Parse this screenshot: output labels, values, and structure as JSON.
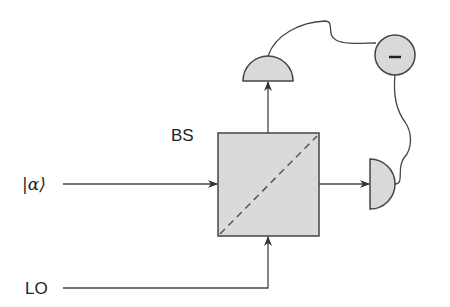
{
  "diagram": {
    "labels": {
      "beam_splitter": "BS",
      "signal": "|α⟩",
      "local_oscillator": "LO",
      "subtractor": "–"
    },
    "colors": {
      "stroke": "#4a4a4a",
      "fill": "#d9d9d9",
      "dashed": "#5a5a5a",
      "background": "#ffffff"
    }
  }
}
